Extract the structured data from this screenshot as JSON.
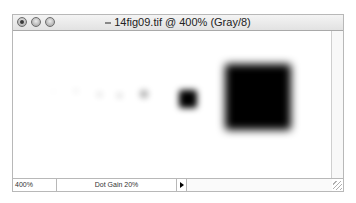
{
  "window": {
    "title": "14fig09.tif @ 400% (Gray/8)",
    "controls": [
      "close",
      "minimize",
      "zoom"
    ]
  },
  "canvas": {
    "dots": [
      {
        "cx": 52,
        "cy": 90,
        "size": 3,
        "blur": 3,
        "opacity": 0.08
      },
      {
        "cx": 75,
        "cy": 90,
        "size": 4,
        "blur": 3,
        "opacity": 0.12
      },
      {
        "cx": 98,
        "cy": 93,
        "size": 5,
        "blur": 3,
        "opacity": 0.16
      },
      {
        "cx": 118,
        "cy": 94,
        "size": 5,
        "blur": 3,
        "opacity": 0.2
      },
      {
        "cx": 143,
        "cy": 93,
        "size": 8,
        "blur": 3,
        "opacity": 0.35
      },
      {
        "cx": 187,
        "cy": 98,
        "size": 18,
        "blur": 3,
        "opacity": 1.0
      },
      {
        "cx": 257,
        "cy": 96,
        "size": 66,
        "blur": 4,
        "opacity": 1.0
      }
    ]
  },
  "statusbar": {
    "zoom": "400%",
    "doc_info": "Dot Gain 20%",
    "menu_arrow": "right-triangle-icon"
  }
}
